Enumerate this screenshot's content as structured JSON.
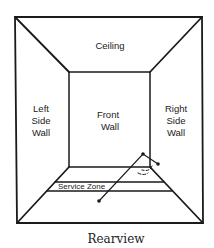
{
  "diagram": {
    "title": "Rearview",
    "labels": {
      "ceiling": "Ceiling",
      "left_wall": [
        "Left",
        "Side",
        "Wall"
      ],
      "front_wall": [
        "Front",
        "Wall"
      ],
      "right_wall": [
        "Right",
        "Side",
        "Wall"
      ],
      "service_zone": "Service Zone"
    },
    "colors": {
      "line": "#1a1a1a",
      "background": "#ffffff"
    }
  }
}
